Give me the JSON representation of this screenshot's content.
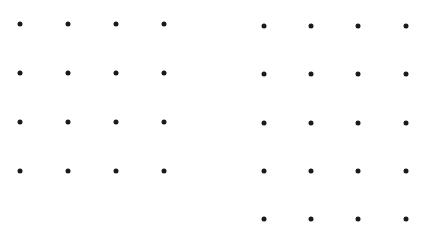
{
  "dot_color": "#1a1a1a",
  "grids": [
    {
      "name": "left-grid",
      "rows": 4,
      "cols": 4,
      "xs": [
        20,
        68,
        116,
        164
      ],
      "ys": [
        24,
        73,
        122,
        171
      ]
    },
    {
      "name": "right-grid",
      "rows": 5,
      "cols": 4,
      "xs": [
        264,
        311,
        358,
        406
      ],
      "ys": [
        26,
        74,
        123,
        171,
        219
      ]
    }
  ]
}
